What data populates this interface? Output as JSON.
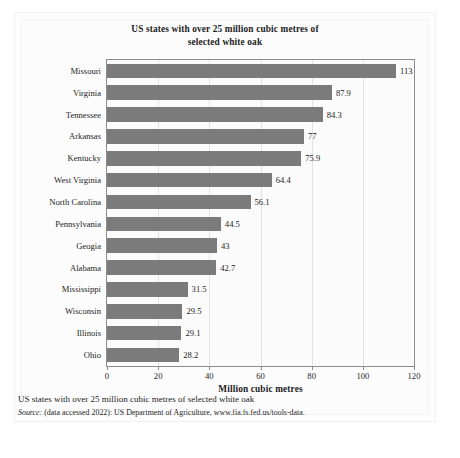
{
  "chart_data": {
    "type": "bar",
    "orientation": "horizontal",
    "title": "US states with over 25 million cubic metres of selected white oak",
    "title_line1": "US states with over 25 million cubic metres of",
    "title_line2": "selected white oak",
    "xlabel": "Million cubic metres",
    "ylabel": "",
    "xlim": [
      0,
      120
    ],
    "xticks": [
      0,
      20,
      40,
      60,
      80,
      100,
      120
    ],
    "xtick_labels": [
      "0",
      "20",
      "40",
      "60",
      "80",
      "100",
      "120"
    ],
    "grid": true,
    "grid_axis": "x",
    "legend": false,
    "bar_color": "#7b7b7b",
    "categories": [
      "Missouri",
      "Virginia",
      "Tennessee",
      "Arkansas",
      "Kentucky",
      "West Virginia",
      "North Carolina",
      "Pennsylvania",
      "Geogia",
      "Alabama",
      "Mississippi",
      "Wisconsin",
      "Illinois",
      "Ohio"
    ],
    "values": [
      113,
      87.9,
      84.3,
      77,
      75.9,
      64.4,
      56.1,
      44.5,
      43,
      42.7,
      31.5,
      29.5,
      29.1,
      28.2
    ],
    "value_labels": [
      "113",
      "87.9",
      "84.3",
      "77",
      "75.9",
      "64.4",
      "56.1",
      "44.5",
      "43",
      "42.7",
      "31.5",
      "29.5",
      "29.1",
      "28.2"
    ]
  },
  "caption": {
    "text": "US states with over 25 million cubic metres of selected white oak",
    "source_label": "Source:",
    "source_text": " (data accessed 2022): US Department of Agriculture, www.fia.fs.fed.us/tools-data."
  }
}
